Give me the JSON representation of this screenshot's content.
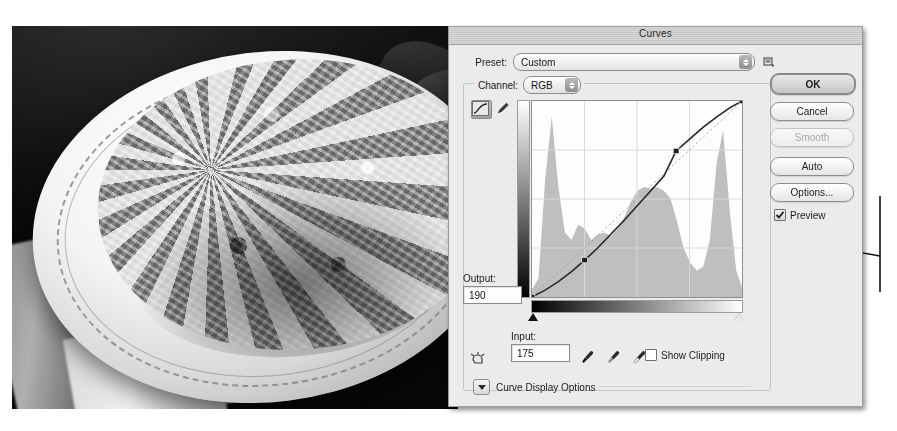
{
  "window": {
    "title": "Curves"
  },
  "preset": {
    "label": "Preset:",
    "value": "Custom",
    "menu_icon": "preset-menu-icon",
    "options": [
      "Custom",
      "Default",
      "Color Negative (RGB)",
      "Cross Process (RGB)",
      "Darker (RGB)",
      "Increase Contrast (RGB)",
      "Lighter (RGB)",
      "Linear Contrast (RGB)",
      "Medium Contrast (RGB)",
      "Negative (RGB)",
      "Strong Contrast (RGB)"
    ]
  },
  "channel": {
    "label": "Channel:",
    "value": "RGB",
    "options": [
      "RGB",
      "Red",
      "Green",
      "Blue"
    ]
  },
  "tools": {
    "curve_tool": "curve-edit-icon",
    "pencil_tool": "pencil-icon",
    "scrubby_tool": "on-image-adjustment-icon"
  },
  "output": {
    "label": "Output:",
    "value": "190"
  },
  "input": {
    "label": "Input:",
    "value": "175"
  },
  "eyedroppers": [
    {
      "name": "black-point-eyedropper"
    },
    {
      "name": "gray-point-eyedropper"
    },
    {
      "name": "white-point-eyedropper"
    }
  ],
  "show_clipping": {
    "label": "Show Clipping",
    "checked": false
  },
  "curve_display_options": {
    "label": "Curve Display Options",
    "expanded": false
  },
  "buttons": {
    "ok": "OK",
    "cancel": "Cancel",
    "smooth": "Smooth",
    "auto": "Auto",
    "options": "Options..."
  },
  "preview": {
    "label": "Preview",
    "checked": true
  },
  "sliders": {
    "black_point": 0,
    "white_point": 255
  },
  "colors": {
    "dialog_bg": "#ebebeb",
    "title_bar": "#cfcfcf",
    "plot_bg": "#fdfdfd",
    "histogram": "#b4b4b4",
    "curve_line": "#2b2b2b",
    "grid": "#d8d8d8",
    "border": "#8e8e8e"
  },
  "chart_data": {
    "type": "line",
    "title": "Curves",
    "xlabel": "Input",
    "ylabel": "Output",
    "xlim": [
      0,
      255
    ],
    "ylim": [
      0,
      255
    ],
    "grid": true,
    "grid_divisions": 4,
    "legend": "none",
    "series": [
      {
        "name": "RGB tone curve",
        "control_points": [
          {
            "input": 0,
            "output": 0
          },
          {
            "input": 64,
            "output": 48
          },
          {
            "input": 175,
            "output": 190
          },
          {
            "input": 255,
            "output": 255
          }
        ],
        "curve": [
          [
            0,
            0
          ],
          [
            16,
            9
          ],
          [
            32,
            20
          ],
          [
            48,
            33
          ],
          [
            64,
            48
          ],
          [
            80,
            64
          ],
          [
            96,
            82
          ],
          [
            112,
            100
          ],
          [
            128,
            119
          ],
          [
            144,
            138
          ],
          [
            160,
            157
          ],
          [
            175,
            190
          ],
          [
            192,
            206
          ],
          [
            208,
            221
          ],
          [
            224,
            234
          ],
          [
            240,
            246
          ],
          [
            255,
            255
          ]
        ]
      },
      {
        "name": "histogram",
        "x": [
          0,
          8,
          16,
          24,
          32,
          40,
          48,
          56,
          64,
          72,
          80,
          88,
          96,
          104,
          112,
          120,
          128,
          136,
          144,
          152,
          160,
          168,
          176,
          184,
          192,
          200,
          208,
          216,
          224,
          232,
          240,
          248,
          255
        ],
        "values": [
          4,
          10,
          62,
          95,
          58,
          34,
          30,
          38,
          36,
          30,
          33,
          34,
          32,
          36,
          42,
          50,
          56,
          58,
          57,
          58,
          56,
          52,
          40,
          26,
          18,
          14,
          16,
          30,
          70,
          88,
          46,
          14,
          5
        ]
      },
      {
        "name": "diagonal reference",
        "points": [
          [
            0,
            0
          ],
          [
            255,
            255
          ]
        ]
      }
    ]
  },
  "annotation": {
    "leader_line": true,
    "bracket": true
  }
}
